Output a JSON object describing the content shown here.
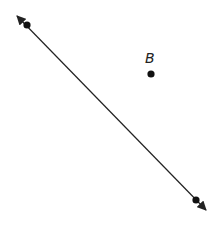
{
  "diagram": {
    "type": "geometry-line-and-point",
    "line": {
      "start": [
        16,
        15
      ],
      "end": [
        207,
        211
      ],
      "arrowheads": "both",
      "color": "#222222",
      "points_on_line": [
        {
          "x": 27,
          "y": 25,
          "label": ""
        },
        {
          "x": 196,
          "y": 200,
          "label": ""
        }
      ]
    },
    "point_b": {
      "x": 151,
      "y": 74,
      "label": "B",
      "label_x": 145,
      "label_y": 63
    },
    "colors": {
      "stroke": "#222222",
      "point": "#111111",
      "background": "#ffffff"
    }
  }
}
